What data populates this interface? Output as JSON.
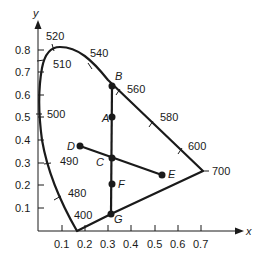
{
  "diagram": {
    "type": "CIE chromaticity diagram",
    "axes": {
      "x_title": "x",
      "y_title": "y",
      "x_ticks": [
        "0.1",
        "0.2",
        "0.3",
        "0.4",
        "0.5",
        "0.6",
        "0.7"
      ],
      "y_ticks": [
        "0.1",
        "0.2",
        "0.3",
        "0.4",
        "0.5",
        "0.6",
        "0.7",
        "0.8"
      ]
    },
    "wavelength_labels": [
      "520",
      "510",
      "540",
      "560",
      "580",
      "600",
      "500",
      "490",
      "480",
      "400",
      "700"
    ],
    "points": [
      {
        "label": "A",
        "x": 0.32,
        "y": 0.5
      },
      {
        "label": "B",
        "x": 0.32,
        "y": 0.64
      },
      {
        "label": "C",
        "x": 0.32,
        "y": 0.32
      },
      {
        "label": "D",
        "x": 0.18,
        "y": 0.37
      },
      {
        "label": "E",
        "x": 0.53,
        "y": 0.25
      },
      {
        "label": "F",
        "x": 0.32,
        "y": 0.2
      },
      {
        "label": "G",
        "x": 0.31,
        "y": 0.07
      }
    ],
    "segments": [
      "B-G",
      "D-E",
      "G-700"
    ],
    "colors": {
      "stroke": "#1a1a1a",
      "background": "#ffffff"
    }
  }
}
